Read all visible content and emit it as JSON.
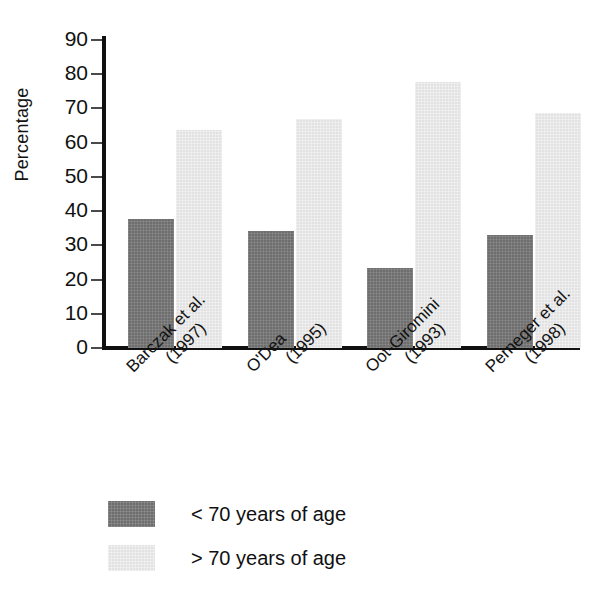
{
  "chart_data": {
    "type": "bar",
    "title": "",
    "subtitle": "",
    "xlabel": "",
    "ylabel": "Percentage",
    "ylim": [
      0,
      90
    ],
    "ytick_step": 10,
    "yticks": [
      90,
      80,
      70,
      60,
      50,
      40,
      30,
      20,
      10,
      0
    ],
    "grid": false,
    "legend_position": "bottom-left",
    "categories": [
      "Barczak et al. (1997)",
      "O'Dea (1995)",
      "Oot-Giromini (1993)",
      "Perneger et al. (1998)"
    ],
    "category_lines": [
      [
        "Barczak et al.",
        "(1997)"
      ],
      [
        "O'Dea",
        "(1995)"
      ],
      [
        "Oot-Giromini",
        "(1993)"
      ],
      [
        "Perneger et al.",
        "(1998)"
      ]
    ],
    "series": [
      {
        "name": "< 70 years of age",
        "color": "#6e6e6e",
        "values": [
          37.8,
          34.3,
          23.5,
          33.0
        ]
      },
      {
        "name": "> 70 years of age",
        "color": "#e2e2e2",
        "values": [
          63.6,
          67.0,
          77.8,
          68.6
        ]
      }
    ]
  },
  "axis": {
    "y_title": "Percentage",
    "tick_labels": [
      "90",
      "80",
      "70",
      "60",
      "50",
      "40",
      "30",
      "20",
      "10",
      "0"
    ]
  },
  "legend": {
    "items": [
      {
        "label": "< 70 years of age",
        "swatch": "low"
      },
      {
        "label": "> 70 years of age",
        "swatch": "high"
      }
    ]
  }
}
